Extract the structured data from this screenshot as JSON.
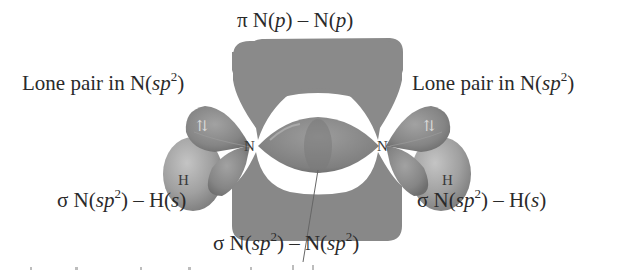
{
  "figure": {
    "labels": {
      "pi_bond": {
        "sym": "π",
        "a": "N(",
        "ai": "p",
        "b": ") – N(",
        "bi": "p",
        "c": ")"
      },
      "lone_pair_left": {
        "pre": "Lone pair in N(",
        "it": "sp",
        "sup": "2",
        "post": ")"
      },
      "lone_pair_right": {
        "pre": "Lone pair in N(",
        "it": "sp",
        "sup": "2",
        "post": ")"
      },
      "sigma_nh_left": {
        "sym": "σ",
        "a": "N(",
        "ai": "sp",
        "asup": "2",
        "b": ") – H(",
        "bi": "s",
        "c": ")"
      },
      "sigma_nh_right": {
        "sym": "σ",
        "a": "N(",
        "ai": "sp",
        "asup": "2",
        "b": ") – H(",
        "bi": "s",
        "c": ")"
      },
      "sigma_nn": {
        "sym": "σ",
        "a": "N(",
        "ai": "sp",
        "asup": "2",
        "b": ") – N(",
        "bi": "sp",
        "bsup": "2",
        "c": ")"
      }
    },
    "atoms": {
      "n_left": "N",
      "n_right": "N",
      "h_left": "H",
      "h_right": "H"
    },
    "electron_pair_symbol": "⇅",
    "colors": {
      "orbital_dark": "#7d7d7d",
      "orbital_mid": "#8c8c8c",
      "orbital_light": "#a9a9a9",
      "h_sphere": "#9a9a9a",
      "text": "#2a2a2a",
      "background": "#ffffff"
    }
  }
}
